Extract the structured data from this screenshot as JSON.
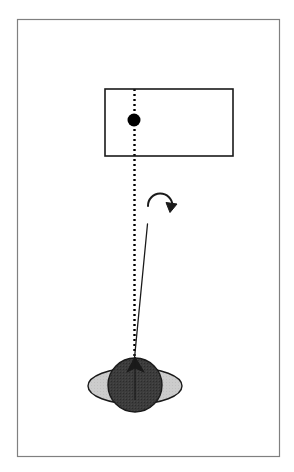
{
  "figure": {
    "domain": "Diagram",
    "canvas": {
      "width": 294,
      "height": 472,
      "background": "#ffffff"
    },
    "colors": {
      "frame_stroke": "#808080",
      "outline_stroke": "#1a1a1a",
      "planet_body": "#3c3c3c",
      "planet_body_dark": "#2e2e2e",
      "ring_fill": "#cccccc",
      "dot_fill": "#000000",
      "dotted_line": "#000000",
      "solid_line": "#1a1a1a",
      "arrow_stroke": "#1a1a1a",
      "background": "#ffffff"
    },
    "elements": {
      "outer_frame": {
        "name": "outer-frame",
        "x": 17,
        "y": 19,
        "width": 262,
        "height": 437,
        "stroke_width": 1.2
      },
      "rectangle_box": {
        "name": "rectangle-box",
        "x": 105,
        "y": 89,
        "width": 128,
        "height": 67,
        "stroke_width": 1.6
      },
      "black_dot": {
        "name": "black-dot",
        "cx": 134,
        "cy": 120,
        "r": 6.5
      },
      "dotted_axis_line": {
        "name": "dotted-axis-line",
        "x": 134.5,
        "y1": 89,
        "y2": 360,
        "dash": "2 3",
        "stroke_width": 2.4
      },
      "solid_tilt_line": {
        "name": "solid-tilt-line",
        "x1": 147.5,
        "y1": 224,
        "x2": 134.5,
        "y2": 358,
        "stroke_width": 1.3
      },
      "rotation_arrow": {
        "name": "rotation-arrow",
        "cx": 160,
        "cy": 202,
        "radius": 12,
        "stroke_width": 2.0,
        "direction": "clockwise"
      },
      "planet_rings": {
        "name": "planet-rings",
        "cx": 135,
        "cy": 386,
        "rx": 47,
        "ry": 18,
        "stroke_width": 1.4
      },
      "planet_sphere": {
        "name": "planet-sphere",
        "cx": 135,
        "cy": 385,
        "r": 27,
        "stroke_width": 1.4
      },
      "axis_pole_marker": {
        "name": "axis-pole-marker",
        "apex_x": 135,
        "apex_y": 357,
        "left_x": 127,
        "right_x": 144,
        "base_y": 372
      }
    },
    "labels": {
      "caption": "",
      "legend": []
    }
  }
}
